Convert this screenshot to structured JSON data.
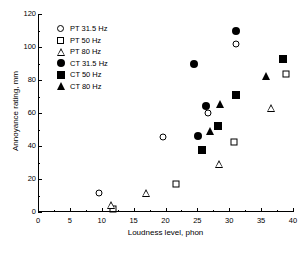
{
  "chart_data": {
    "type": "scatter",
    "title": "",
    "xlabel": "Loudness level, phon",
    "ylabel": "Annoyance rating, mm",
    "xlim": [
      0,
      40
    ],
    "ylim": [
      0,
      120
    ],
    "xticks": [
      0,
      5,
      10,
      15,
      20,
      25,
      30,
      35,
      40
    ],
    "xticklabels": [
      "0",
      "5",
      "10",
      "15",
      "20",
      "25",
      "30",
      "35",
      "40"
    ],
    "yticks": [
      0,
      20,
      40,
      60,
      80,
      100,
      120
    ],
    "yticklabels": [
      "0",
      "20",
      "40",
      "60",
      "80",
      "100",
      "120"
    ],
    "x_minor_ticks": [
      2.5,
      7.5,
      12.5,
      17.5,
      22.5,
      27.5,
      32.5,
      37.5
    ],
    "y_minor_ticks": [
      10,
      30,
      50,
      70,
      90,
      110
    ],
    "grid": false,
    "legend_position": "upper-left",
    "series": [
      {
        "name": "PT 31.5 Hz",
        "marker": "circle-open",
        "points": [
          {
            "x": 9.5,
            "y": 11.3
          },
          {
            "x": 19.6,
            "y": 45.2
          },
          {
            "x": 26.6,
            "y": 60.2
          },
          {
            "x": 31.0,
            "y": 102.0
          }
        ]
      },
      {
        "name": "PT 50 Hz",
        "marker": "square-open",
        "points": [
          {
            "x": 11.7,
            "y": 2.0
          },
          {
            "x": 21.6,
            "y": 17.0
          },
          {
            "x": 30.7,
            "y": 42.6
          },
          {
            "x": 38.9,
            "y": 83.6
          }
        ]
      },
      {
        "name": "PT 80 Hz",
        "marker": "triangle-open",
        "points": [
          {
            "x": 11.5,
            "y": 4.5
          },
          {
            "x": 17.0,
            "y": 11.8
          },
          {
            "x": 28.4,
            "y": 29.0
          },
          {
            "x": 36.6,
            "y": 63.0
          }
        ]
      },
      {
        "name": "CT 31.5 Hz",
        "marker": "circle-filled",
        "points": [
          {
            "x": 25.1,
            "y": 46.0
          },
          {
            "x": 26.4,
            "y": 64.0
          },
          {
            "x": 24.4,
            "y": 90.0
          },
          {
            "x": 31.0,
            "y": 109.5
          }
        ]
      },
      {
        "name": "CT 50 Hz",
        "marker": "square-filled",
        "points": [
          {
            "x": 25.7,
            "y": 37.7
          },
          {
            "x": 28.3,
            "y": 52.2
          },
          {
            "x": 31.0,
            "y": 70.7
          },
          {
            "x": 38.4,
            "y": 92.7
          }
        ]
      },
      {
        "name": "CT 80 Hz",
        "marker": "triangle-filled",
        "points": [
          {
            "x": 27.0,
            "y": 48.8
          },
          {
            "x": 28.5,
            "y": 65.6
          },
          {
            "x": 35.8,
            "y": 82.6
          }
        ]
      }
    ]
  }
}
